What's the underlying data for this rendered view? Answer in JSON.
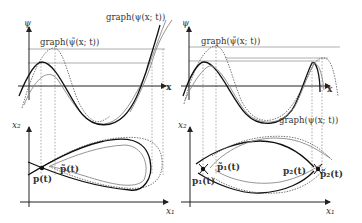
{
  "figure": {
    "left_panel": {
      "top": {
        "y_axis_label": "ψ",
        "x_axis_label": "x",
        "graph_tilde_label": "graph(ψ̃(x; t))",
        "graph_label": "graph(ψ(x; t))"
      },
      "bottom": {
        "y_axis_label": "x₂",
        "x_axis_label": "x₁",
        "point_label": "p(t)",
        "point_tilde_label": "p̃(t)"
      }
    },
    "right_panel": {
      "top": {
        "y_axis_label": "ψ",
        "x_axis_label": "x",
        "graph_tilde_label": "graph(ψ̃(x; t))",
        "graph_label": "graph(ψ(x; t))"
      },
      "bottom": {
        "y_axis_label": "x₂",
        "x_axis_label": "x₁",
        "point1_label": "p₁(t)",
        "point1_tilde_label": "p̃₁(t)",
        "point2_label": "p₂(t)",
        "point2_tilde_label": "p̃₂(t)"
      }
    }
  }
}
